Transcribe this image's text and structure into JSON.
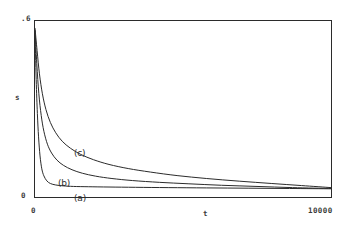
{
  "figure": {
    "background_color": "#ffffff",
    "frame_color": "#2b2b2b",
    "curve_color": "#2b2b2b"
  },
  "axes": {
    "y_tick_top": ".6",
    "y_tick_bottom": "0",
    "y_title": "s",
    "x_tick_left": "0",
    "x_tick_right": "10000",
    "x_title": "t"
  },
  "annotations": {
    "curve_a": "(a)",
    "curve_b": "(b)",
    "curve_c": "(c)"
  },
  "chart_data": {
    "type": "line",
    "title": "",
    "subtitle": "",
    "xlabel": "t",
    "ylabel": "s",
    "xlim": [
      0,
      10000
    ],
    "ylim": [
      0,
      0.6
    ],
    "xticks": [
      0,
      10000
    ],
    "xticklabels": [
      "0",
      "10000"
    ],
    "yticks": [
      0,
      0.6
    ],
    "yticklabels": [
      "0",
      ".6"
    ],
    "grid": false,
    "legend": "inline-annotations",
    "legend_position": "inline",
    "series": [
      {
        "name": "(a)",
        "label": "(a)",
        "color": "#2b2b2b",
        "x": [
          0,
          40,
          80,
          120,
          170,
          230,
          300,
          400,
          520,
          700,
          950,
          1300,
          1800,
          2500,
          3400,
          4500,
          5800,
          7200,
          8600,
          10000
        ],
        "y": [
          0.565,
          0.4,
          0.285,
          0.205,
          0.14,
          0.096,
          0.072,
          0.055,
          0.046,
          0.041,
          0.038,
          0.036,
          0.035,
          0.034,
          0.033,
          0.032,
          0.031,
          0.03,
          0.029,
          0.028
        ]
      },
      {
        "name": "(b)",
        "label": "(b)",
        "color": "#2b2b2b",
        "x": [
          0,
          60,
          130,
          210,
          300,
          420,
          560,
          740,
          960,
          1250,
          1600,
          2050,
          2600,
          3300,
          4200,
          5200,
          6300,
          7500,
          8700,
          10000
        ],
        "y": [
          0.57,
          0.455,
          0.352,
          0.278,
          0.224,
          0.18,
          0.15,
          0.126,
          0.108,
          0.093,
          0.081,
          0.071,
          0.063,
          0.056,
          0.05,
          0.045,
          0.04,
          0.036,
          0.032,
          0.029
        ]
      },
      {
        "name": "(c)",
        "label": "(c)",
        "color": "#2b2b2b",
        "x": [
          0,
          70,
          150,
          250,
          370,
          520,
          700,
          920,
          1200,
          1550,
          1980,
          2500,
          3150,
          3900,
          4800,
          5800,
          6900,
          8000,
          9000,
          10000
        ],
        "y": [
          0.575,
          0.5,
          0.42,
          0.352,
          0.298,
          0.254,
          0.219,
          0.19,
          0.166,
          0.145,
          0.127,
          0.111,
          0.097,
          0.085,
          0.073,
          0.063,
          0.054,
          0.046,
          0.039,
          0.032
        ]
      }
    ]
  }
}
